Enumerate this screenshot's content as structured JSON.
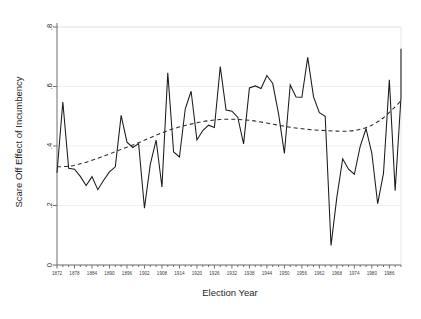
{
  "chart_data": {
    "type": "line",
    "title": "",
    "xlabel": "Election Year",
    "ylabel": "Scare Off Effect of Incumbency",
    "xlim": [
      1872,
      1990
    ],
    "ylim": [
      0,
      0.8
    ],
    "grid": true,
    "legend_position": "none",
    "x_tick_labels": [
      "1872",
      "1878",
      "1884",
      "1890",
      "1896",
      "1902",
      "1908",
      "1914",
      "1920",
      "1926",
      "1932",
      "1938",
      "1944",
      "1950",
      "1956",
      "1962",
      "1968",
      "1974",
      "1980",
      "1986"
    ],
    "x_tick_values": [
      1872,
      1878,
      1884,
      1890,
      1896,
      1902,
      1908,
      1914,
      1920,
      1926,
      1932,
      1938,
      1944,
      1950,
      1956,
      1962,
      1968,
      1974,
      1980,
      1986
    ],
    "x_minor_tick_values": [
      1874,
      1876,
      1880,
      1882,
      1886,
      1888,
      1892,
      1894,
      1898,
      1900,
      1904,
      1906,
      1910,
      1912,
      1916,
      1918,
      1922,
      1924,
      1928,
      1930,
      1934,
      1936,
      1940,
      1942,
      1946,
      1948,
      1952,
      1954,
      1958,
      1960,
      1964,
      1966,
      1970,
      1972,
      1976,
      1978,
      1982,
      1984,
      1988,
      1990
    ],
    "y_tick_labels": [
      "0",
      ".2",
      ".4",
      ".6",
      ".8"
    ],
    "y_tick_values": [
      0,
      0.2,
      0.4,
      0.6,
      0.8
    ],
    "series": [
      {
        "name": "Scare Off Effect",
        "style": "solid",
        "x": [
          1872,
          1874,
          1876,
          1878,
          1880,
          1882,
          1884,
          1886,
          1888,
          1890,
          1892,
          1894,
          1896,
          1898,
          1900,
          1902,
          1904,
          1906,
          1908,
          1910,
          1912,
          1914,
          1916,
          1918,
          1920,
          1922,
          1924,
          1926,
          1928,
          1930,
          1932,
          1934,
          1936,
          1938,
          1940,
          1942,
          1944,
          1946,
          1948,
          1950,
          1952,
          1954,
          1956,
          1958,
          1960,
          1962,
          1964,
          1966,
          1968,
          1970,
          1972,
          1974,
          1976,
          1978,
          1980,
          1982,
          1984,
          1986,
          1988,
          1990
        ],
        "values": [
          0.31,
          0.548,
          0.325,
          0.322,
          0.298,
          0.267,
          0.297,
          0.253,
          0.285,
          0.313,
          0.33,
          0.503,
          0.413,
          0.395,
          0.408,
          0.191,
          0.338,
          0.42,
          0.262,
          0.646,
          0.38,
          0.363,
          0.525,
          0.584,
          0.42,
          0.452,
          0.47,
          0.462,
          0.667,
          0.521,
          0.517,
          0.497,
          0.407,
          0.595,
          0.602,
          0.593,
          0.637,
          0.61,
          0.508,
          0.375,
          0.605,
          0.565,
          0.564,
          0.698,
          0.565,
          0.512,
          0.5,
          0.066,
          0.228,
          0.357,
          0.322,
          0.305,
          0.399,
          0.458,
          0.375,
          0.206,
          0.309,
          0.623,
          0.25,
          0.565
        ]
      }
    ],
    "trend": {
      "name": "Fitted trend (quartic)",
      "style": "dashed",
      "x": [
        1872,
        1876,
        1880,
        1884,
        1888,
        1892,
        1896,
        1900,
        1904,
        1908,
        1912,
        1916,
        1920,
        1924,
        1928,
        1932,
        1936,
        1940,
        1944,
        1948,
        1952,
        1956,
        1960,
        1964,
        1968,
        1972,
        1976,
        1980,
        1984,
        1988,
        1990
      ],
      "values": [
        0.33,
        0.332,
        0.34,
        0.352,
        0.366,
        0.381,
        0.396,
        0.411,
        0.428,
        0.444,
        0.458,
        0.469,
        0.478,
        0.485,
        0.489,
        0.49,
        0.488,
        0.484,
        0.477,
        0.47,
        0.463,
        0.458,
        0.454,
        0.452,
        0.45,
        0.45,
        0.456,
        0.47,
        0.495,
        0.532,
        0.553
      ]
    },
    "series_tail": {
      "comment_not_rendered": "",
      "x": [
        1990
      ],
      "values": [
        0.727
      ]
    }
  },
  "figure": {
    "background_color": "#ffffff",
    "axis_color": "#6f6f6f",
    "series_color": "#1a1a1a",
    "grid_color": "#f0f0f0"
  }
}
